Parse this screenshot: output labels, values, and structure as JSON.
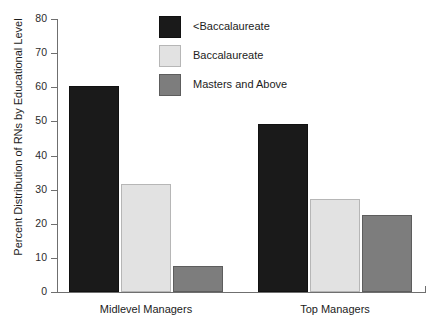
{
  "chart_data": {
    "type": "bar",
    "title": "",
    "subtitle": "",
    "xlabel": "",
    "ylabel": "Percent Distribution of RNs by Educational Level",
    "categories": [
      "Midlevel Managers",
      "Top Managers"
    ],
    "series": [
      {
        "name": "<Baccalaureate",
        "values": [
          60.3,
          49.3
        ],
        "color": "#1a1a1a"
      },
      {
        "name": "Baccalaureate",
        "values": [
          31.7,
          27.3
        ],
        "color": "#e2e2e2"
      },
      {
        "name": "Masters and Above",
        "values": [
          7.6,
          22.6
        ],
        "color": "#7d7d7d"
      }
    ],
    "ylim": [
      0,
      80
    ],
    "ytick_labels": [
      "0",
      "10",
      "20",
      "30",
      "40",
      "50",
      "60",
      "70",
      "80"
    ],
    "ytick_values": [
      0,
      10,
      20,
      30,
      40,
      50,
      60,
      70,
      80
    ],
    "grid": false,
    "legend_position": "top-center"
  },
  "legend": {
    "entries": [
      {
        "label": "<Baccalaureate"
      },
      {
        "label": "Baccalaureate"
      },
      {
        "label": "Masters and Above"
      }
    ]
  },
  "axes": {
    "y_title": "Percent Distribution of RNs by Educational Level"
  }
}
